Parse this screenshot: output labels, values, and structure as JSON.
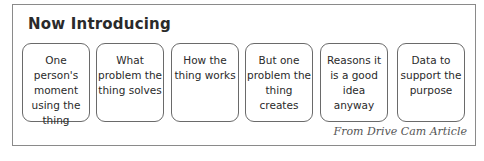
{
  "title": "Now Introducing",
  "cards": [
    {
      "label": "One person's moment using the thing"
    },
    {
      "label": "What problem the thing solves"
    },
    {
      "label": "How the thing works"
    },
    {
      "label": "But one problem the thing creates"
    },
    {
      "label": "Reasons it is a good idea anyway"
    },
    {
      "label": "Data to support the purpose"
    }
  ],
  "source": "From Drive Cam Article",
  "colors": {
    "frame_border": "#8a8a8a",
    "card_border": "#6a6a6a",
    "text": "#2a2a2a",
    "source_text": "#555555"
  }
}
